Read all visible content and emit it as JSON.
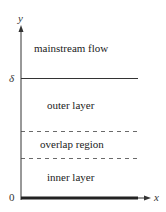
{
  "diagram": {
    "axes": {
      "y_label": "y",
      "x_label": "x",
      "origin_label": "0",
      "delta_label": "δ"
    },
    "regions": [
      {
        "id": "mainstream",
        "label": "mainstream flow"
      },
      {
        "id": "outer",
        "label": "outer layer"
      },
      {
        "id": "overlap",
        "label": "overlap region"
      },
      {
        "id": "inner",
        "label": "inner layer"
      }
    ],
    "boundaries": [
      {
        "id": "delta",
        "style": "solid"
      },
      {
        "id": "outer-overlap",
        "style": "dashed"
      },
      {
        "id": "overlap-inner",
        "style": "dashed"
      },
      {
        "id": "wall",
        "style": "thick"
      }
    ],
    "colors": {
      "line": "#333333",
      "text": "#222222",
      "background": "#ffffff"
    }
  }
}
